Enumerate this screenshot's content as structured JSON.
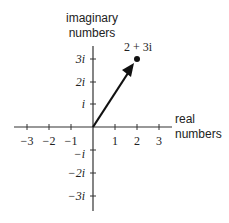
{
  "diagram": {
    "y_axis_label": [
      "imaginary",
      "numbers"
    ],
    "x_axis_label": [
      "real",
      "numbers"
    ],
    "x_ticks": [
      {
        "label": "−3",
        "value": -3
      },
      {
        "label": "−2",
        "value": -2
      },
      {
        "label": "−1",
        "value": -1
      },
      {
        "label": "1",
        "value": 1
      },
      {
        "label": "2",
        "value": 2
      },
      {
        "label": "3",
        "value": 3
      }
    ],
    "y_ticks": [
      {
        "label": "3i",
        "value": 3
      },
      {
        "label": "2i",
        "value": 2
      },
      {
        "label": "i",
        "value": 1
      },
      {
        "label": "−i",
        "value": -1
      },
      {
        "label": "−2i",
        "value": -2
      },
      {
        "label": "−3i",
        "value": -3
      }
    ],
    "point": {
      "label": "2 + 3i",
      "real": 2,
      "imaginary": 3
    },
    "vector": {
      "from": [
        0,
        0
      ],
      "to": [
        2,
        3
      ]
    },
    "colors": {
      "axis": "#333333",
      "vector": "#111111",
      "text": "#222222"
    }
  }
}
